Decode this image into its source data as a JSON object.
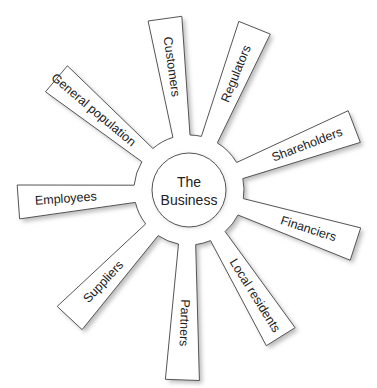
{
  "diagram": {
    "center": {
      "line1": "The",
      "line2": "Business",
      "cx": 189,
      "cy": 190,
      "r": 37
    },
    "ring_radius": 55,
    "stroke_color": "#555555",
    "fill_color": "#ffffff",
    "shadow_color": "#bdbdbd",
    "arms": [
      {
        "label": "Customers",
        "angle": -98,
        "length": 178
      },
      {
        "label": "Regulators",
        "angle": -68,
        "length": 180
      },
      {
        "label": "Shareholders",
        "angle": -21,
        "length": 182
      },
      {
        "label": "Financiers",
        "angle": 18,
        "length": 180
      },
      {
        "label": "Local residents",
        "angle": 58,
        "length": 178
      },
      {
        "label": "Partners",
        "angle": 92,
        "length": 195
      },
      {
        "label": "Suppliers",
        "angle": 133,
        "length": 180
      },
      {
        "label": "Employees",
        "angle": 176,
        "length": 176
      },
      {
        "label": "General population",
        "angle": -140,
        "length": 178
      }
    ]
  }
}
